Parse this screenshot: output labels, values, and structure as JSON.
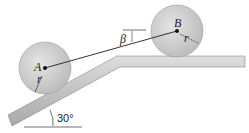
{
  "diagram": {
    "labels": {
      "point_a": "A",
      "point_b": "B",
      "radius_a": "r",
      "radius_b": "r",
      "angle_beta": "β",
      "incline_angle": "30°"
    },
    "colors": {
      "wheel_fill": "#cfcfcf",
      "surface_fill": "#c8c8c8",
      "line": "#333333"
    }
  }
}
